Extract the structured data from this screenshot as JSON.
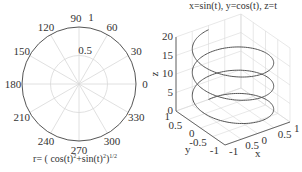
{
  "chart_data": [
    {
      "type": "line",
      "subtype": "polar",
      "title": "r= ( cos(t)^2+sin(t)^2)^1/2",
      "title_parts": {
        "prefix": "r= ( cos(t)",
        "sup1": "2",
        "mid": "+sin(t)",
        "sup2": "2",
        "close": ")",
        "sup3": "1/2"
      },
      "angle_ticks": [
        "0",
        "30",
        "60",
        "90",
        "120",
        "150",
        "180",
        "210",
        "240",
        "270",
        "300",
        "330"
      ],
      "radial_ticks": [
        "0.5",
        "1"
      ],
      "rlim": [
        0,
        1
      ],
      "series": [
        {
          "name": "r",
          "description": "unit circle r=1 for all t",
          "values": [
            1,
            1,
            1,
            1,
            1,
            1,
            1,
            1,
            1,
            1,
            1,
            1,
            1
          ]
        }
      ],
      "grid": true
    },
    {
      "type": "line",
      "subtype": "3d",
      "title": "x=sin(t), y=cos(t), z=t",
      "xlabel": "x",
      "ylabel": "y",
      "zlabel": "z",
      "x_ticks": [
        "-1",
        "0.5",
        "0",
        "0.5",
        "1"
      ],
      "y_ticks": [
        "1",
        "0.5",
        "0",
        "-0.5",
        "-1"
      ],
      "z_ticks": [
        "0",
        "5",
        "10",
        "15",
        "20"
      ],
      "xlim": [
        -1,
        1
      ],
      "ylim": [
        -1,
        1
      ],
      "zlim": [
        0,
        20
      ],
      "t_range": [
        0,
        6.2832,
        12.5664,
        18.8496
      ],
      "series": [
        {
          "name": "helix",
          "x": "sin(t)",
          "y": "cos(t)",
          "z": "t",
          "t_min": 0,
          "t_max": 18.85,
          "turns": 3
        }
      ],
      "grid": true
    }
  ],
  "colors": {
    "line": "#555555",
    "grid": "#d8d8d8",
    "axis": "#444444",
    "text": "#333333"
  }
}
